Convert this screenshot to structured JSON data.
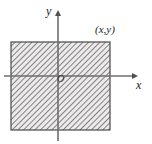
{
  "figure": {
    "name": "cartesian-plane-shaded-rectangle",
    "type": "coordinate-diagram",
    "background_color": "#ffffff",
    "axes": {
      "x_axis": {
        "label": "x",
        "label_style": "italic",
        "color": "#6e6e6e",
        "arrow": "right",
        "y_position_px": 76,
        "start_px": 4,
        "end_px": 138
      },
      "y_axis": {
        "label": "y",
        "label_style": "italic",
        "color": "#6e6e6e",
        "arrow": "up",
        "x_position_px": 58,
        "start_px": 140,
        "end_px": 10
      },
      "origin_label": "O"
    },
    "shaded_region": {
      "name": "hatched-rectangle",
      "fill": "diagonal-hatch",
      "hatch_color": "#6b6b6b",
      "hatch_background": "#e8e8e8",
      "border_color": "#4a4a4a",
      "left_px": 11,
      "top_px": 42,
      "right_px": 110,
      "bottom_px": 130,
      "corner_label": "(x,y)",
      "corner_label_position": "top-right-outside"
    },
    "annotations": [
      {
        "name": "point-label",
        "text": "(x,y)"
      },
      {
        "name": "origin-label",
        "text": "O"
      },
      {
        "name": "x-axis-label",
        "text": "x"
      },
      {
        "name": "y-axis-label",
        "text": "y"
      }
    ]
  }
}
